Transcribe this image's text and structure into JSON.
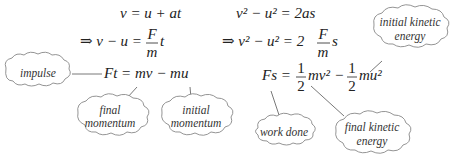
{
  "equations": {
    "left": {
      "line1": "v = u + at",
      "line2_prefix": "⇒ v − u =",
      "line2_frac_num": "F",
      "line2_frac_den": "m",
      "line2_suffix": "t",
      "line3": "Ft = mv − mu"
    },
    "right": {
      "line1": "v² − u² = 2as",
      "line2_prefix": "⇒ v² − u² = 2",
      "line2_frac_num": "F",
      "line2_frac_den": "m",
      "line2_suffix": "s",
      "line3_prefix": "Fs =",
      "half_num": "1",
      "half_den": "2",
      "term1": "mv²",
      "minus": "−",
      "term2": "mu²"
    }
  },
  "annotations": {
    "impulse": "impulse",
    "final_momentum_1": "final",
    "final_momentum_2": "momentum",
    "initial_momentum_1": "initial",
    "initial_momentum_2": "momentum",
    "initial_ke_1": "initial kinetic",
    "initial_ke_2": "energy",
    "work_done": "work done",
    "final_ke_1": "final kinetic",
    "final_ke_2": "energy"
  }
}
